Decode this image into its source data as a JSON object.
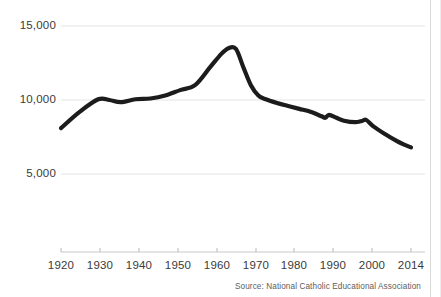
{
  "chart_data": {
    "type": "line",
    "title": "",
    "subtitle": "",
    "xlabel": "",
    "ylabel": "",
    "xlim": [
      1920,
      2014
    ],
    "ylim": [
      3500,
      15800
    ],
    "grid": true,
    "legend": "none",
    "source": "Source: National Catholic Educational Association",
    "yticks": [
      5000,
      10000,
      15000
    ],
    "ytick_labels": [
      "5,000",
      "10,000",
      "15,000"
    ],
    "xticks": [
      1920,
      1930,
      1940,
      1950,
      1960,
      1970,
      1980,
      1990,
      2000,
      2014
    ],
    "xtick_labels": [
      "1920",
      "1930",
      "1940",
      "1950",
      "1960",
      "1970",
      "1980",
      "1990",
      "2000",
      "2014"
    ],
    "series": [
      {
        "name": "Catholic schools",
        "color": "#1c1c1c",
        "x": [
          1920,
          1925,
          1930,
          1933,
          1936,
          1940,
          1944,
          1948,
          1952,
          1956,
          1960,
          1963,
          1965,
          1967,
          1969,
          1971,
          1973,
          1975,
          1978,
          1981,
          1984,
          1987,
          1990,
          1991,
          1992,
          1994,
          1996,
          1999,
          2001,
          2002,
          2004,
          2007,
          2010,
          2012,
          2014
        ],
        "y": [
          8103,
          9200,
          10046,
          10000,
          9850,
          10049,
          10100,
          10300,
          10666,
          11000,
          12200,
          13100,
          13500,
          13450,
          12200,
          11000,
          10300,
          10050,
          9800,
          9600,
          9400,
          9200,
          8900,
          8800,
          9000,
          8800,
          8600,
          8500,
          8600,
          8650,
          8200,
          7700,
          7250,
          7000,
          6800
        ]
      }
    ]
  },
  "axes": {
    "y_label_5000": "5,000",
    "y_label_10000": "10,000",
    "y_label_15000": "15,000",
    "x_label_1920": "1920",
    "x_label_1930": "1930",
    "x_label_1940": "1940",
    "x_label_1950": "1950",
    "x_label_1960": "1960",
    "x_label_1970": "1970",
    "x_label_1980": "1980",
    "x_label_1990": "1990",
    "x_label_2000": "2000",
    "x_label_2014": "2014"
  },
  "footer": {
    "source": "Source: National Catholic Educational Association"
  },
  "colors": {
    "line": "#1c1c1c",
    "gridline": "#e2e2e2",
    "axis": "#c9c9c9",
    "text": "#3a3a3a",
    "source_text": "#5c5c5c",
    "background": "#ffffff"
  }
}
